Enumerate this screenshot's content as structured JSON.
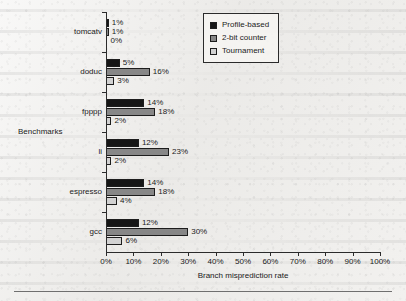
{
  "chart_data": {
    "type": "bar",
    "orientation": "horizontal",
    "title": "",
    "xlabel": "Branch misprediction rate",
    "ylabel": "Benchmarks",
    "categories": [
      "tomcatv",
      "doduc",
      "fpppp",
      "li",
      "espresso",
      "gcc"
    ],
    "series": [
      {
        "name": "Profile-based",
        "color": "#161616",
        "values": [
          1,
          5,
          14,
          12,
          14,
          12
        ],
        "labels": [
          "1%",
          "5%",
          "14%",
          "12%",
          "14%",
          "12%"
        ]
      },
      {
        "name": "2-bit counter",
        "color": "#878787",
        "values": [
          1,
          16,
          18,
          23,
          18,
          30
        ],
        "labels": [
          "1%",
          "16%",
          "18%",
          "23%",
          "18%",
          "30%"
        ]
      },
      {
        "name": "Tournament",
        "color": "#d2d2d2",
        "values": [
          0,
          3,
          2,
          2,
          4,
          6
        ],
        "labels": [
          "0%",
          "3%",
          "2%",
          "2%",
          "4%",
          "6%"
        ]
      }
    ],
    "xlim": [
      0,
      100
    ],
    "xticks": [
      0,
      10,
      20,
      30,
      40,
      50,
      60,
      70,
      80,
      90,
      100
    ],
    "xtick_labels": [
      "0%",
      "10%",
      "20%",
      "30%",
      "40%",
      "50%",
      "60%",
      "70%",
      "80%",
      "90%",
      "100%"
    ],
    "grid": false,
    "legend_position": "top-right",
    "legend_entries": [
      "Profile-based",
      "2-bit counter",
      "Tournament"
    ]
  }
}
